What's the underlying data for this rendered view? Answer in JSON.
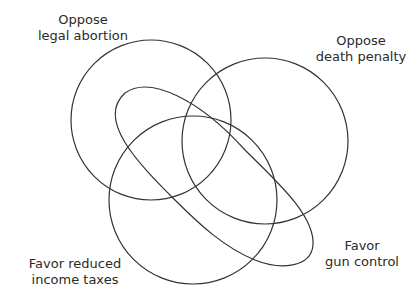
{
  "diagram": {
    "type": "venn",
    "sets": [
      {
        "id": "abortion",
        "line1": "Oppose",
        "line2": "legal abortion",
        "shape": "circle"
      },
      {
        "id": "death_penalty",
        "line1": "Oppose",
        "line2": "death penalty",
        "shape": "circle"
      },
      {
        "id": "taxes",
        "line1": "Favor reduced",
        "line2": "income taxes",
        "shape": "circle"
      },
      {
        "id": "gun_control",
        "line1": "Favor",
        "line2": "gun control",
        "shape": "elongated-loop"
      }
    ],
    "colors": {
      "stroke": "#333333",
      "text": "#2a2a2a",
      "background": "#ffffff"
    }
  }
}
